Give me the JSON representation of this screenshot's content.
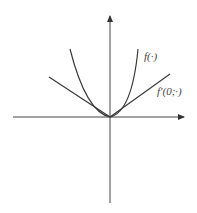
{
  "diagram": {
    "labels": {
      "function": "f(·)",
      "directional_derivative": "f′(0;·)"
    },
    "colors": {
      "line": "#3a3a3a",
      "background": "#ffffff"
    }
  }
}
